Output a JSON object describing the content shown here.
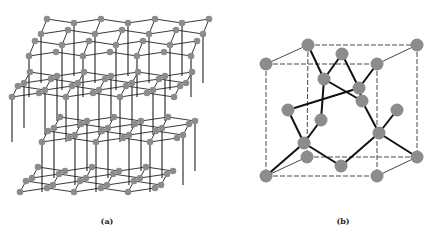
{
  "figure": {
    "panel_a": {
      "label": "(a)",
      "label_pos": [
        107,
        216
      ],
      "title": "Hexagonal (wurtzite-type) lattice",
      "atom_color": "#8c8c8c",
      "bond_color": "#222222",
      "atom_radius": 3.3,
      "layers": [
        {
          "name": "top-upper",
          "origin": [
            47,
            19
          ],
          "dx": 27,
          "pucker": 4,
          "rows": 4,
          "row_shift": [
            -6,
            11
          ],
          "count": 7
        },
        {
          "name": "top-lower",
          "origin": [
            30,
            72
          ],
          "dx": 27,
          "pucker": 4,
          "rows": 4,
          "row_shift": [
            -6,
            7
          ],
          "count": 7
        },
        {
          "name": "bottom-upper",
          "origin": [
            60,
            117
          ],
          "dx": 27,
          "pucker": 4,
          "rows": 4,
          "row_shift": [
            -6,
            7
          ],
          "count": 6
        },
        {
          "name": "bottom-lower",
          "origin": [
            38,
            167
          ],
          "dx": 27,
          "pucker": 4,
          "rows": 4,
          "row_shift": [
            -6,
            7
          ],
          "count": 6
        }
      ],
      "vertical_links": [
        {
          "from": 0,
          "to": 1,
          "every": 2
        },
        {
          "from": 1,
          "to": 2,
          "every": 2
        },
        {
          "from": 2,
          "to": 3,
          "every": 2
        }
      ]
    },
    "panel_b": {
      "label": "(b)",
      "label_pos": [
        343,
        216
      ],
      "title": "Diamond cubic unit cell",
      "atom_color": "#8c8c8c",
      "bond_color": "#111111",
      "edge_color": "#333333",
      "atom_radius": 6.5,
      "atoms": [
        {
          "id": "btl",
          "x": 308,
          "y": 45
        },
        {
          "id": "btr",
          "x": 417,
          "y": 45
        },
        {
          "id": "ftl",
          "x": 266,
          "y": 64
        },
        {
          "id": "ftr",
          "x": 377,
          "y": 64
        },
        {
          "id": "bbl",
          "x": 307,
          "y": 157
        },
        {
          "id": "bbr",
          "x": 417,
          "y": 157
        },
        {
          "id": "fbl",
          "x": 266,
          "y": 176
        },
        {
          "id": "fbr",
          "x": 377,
          "y": 176
        },
        {
          "id": "top",
          "x": 342,
          "y": 54
        },
        {
          "id": "back",
          "x": 362,
          "y": 101
        },
        {
          "id": "left",
          "x": 288,
          "y": 110
        },
        {
          "id": "right",
          "x": 397,
          "y": 110
        },
        {
          "id": "front",
          "x": 321,
          "y": 120
        },
        {
          "id": "bottom",
          "x": 341,
          "y": 166
        },
        {
          "id": "i1",
          "x": 324,
          "y": 79
        },
        {
          "id": "i2",
          "x": 359,
          "y": 88
        },
        {
          "id": "i3",
          "x": 304,
          "y": 143
        },
        {
          "id": "i4",
          "x": 379,
          "y": 133
        }
      ],
      "dashed_edges": [
        [
          "btl",
          "btr"
        ],
        [
          "btl",
          "bbl"
        ],
        [
          "bbl",
          "bbr"
        ],
        [
          "btr",
          "bbr"
        ],
        [
          "ftl",
          "ftr"
        ],
        [
          "ftl",
          "fbl"
        ],
        [
          "fbl",
          "fbr"
        ],
        [
          "ftr",
          "fbr"
        ]
      ],
      "solid_edges": [
        [
          "ftl",
          "btl"
        ],
        [
          "ftr",
          "btr"
        ],
        [
          "fbl",
          "bbl"
        ],
        [
          "fbr",
          "bbr"
        ]
      ],
      "bonds": [
        [
          "i1",
          "btl"
        ],
        [
          "i1",
          "top"
        ],
        [
          "i1",
          "front"
        ],
        [
          "i1",
          "back"
        ],
        [
          "i2",
          "top"
        ],
        [
          "i2",
          "ftr"
        ],
        [
          "i2",
          "back"
        ],
        [
          "i2",
          "left"
        ],
        [
          "i3",
          "fbl"
        ],
        [
          "i3",
          "left"
        ],
        [
          "i3",
          "front"
        ],
        [
          "i3",
          "bottom"
        ],
        [
          "i4",
          "back"
        ],
        [
          "i4",
          "right"
        ],
        [
          "i4",
          "bbr"
        ],
        [
          "i4",
          "bottom"
        ]
      ]
    }
  }
}
